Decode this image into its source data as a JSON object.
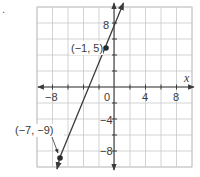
{
  "problem_marker": ".",
  "chart_data": {
    "type": "line",
    "title": "",
    "xlabel": "x",
    "ylabel": "",
    "xlim": [
      -10,
      10
    ],
    "ylim": [
      -10,
      10
    ],
    "grid": true,
    "grid_step": 2,
    "x_ticks": [
      -8,
      4,
      8
    ],
    "x_tick_labels": [
      "−8",
      "4",
      "8"
    ],
    "y_ticks": [
      8,
      -4,
      -8
    ],
    "y_tick_labels": [
      "8",
      "−4",
      "−8"
    ],
    "origin_label": "0",
    "line": {
      "slope": 2.3333,
      "intercept": 7.3333,
      "arrows_both_ends": true,
      "color": "#3a3a3a"
    },
    "points": [
      {
        "x": -1,
        "y": 5,
        "label": "(−1, 5)"
      },
      {
        "x": -7,
        "y": -9,
        "label": "(−7, −9)"
      }
    ]
  },
  "colors": {
    "grid": "#c8c8c8",
    "axis": "#3a3a3a",
    "text": "#3a3a3a"
  }
}
